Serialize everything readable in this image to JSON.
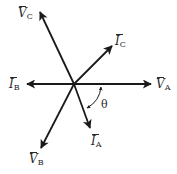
{
  "diagram": {
    "type": "phasor-diagram",
    "origin": [
      74,
      84
    ],
    "stroke_color": "#1a1a1a",
    "phasors": [
      {
        "id": "VA",
        "symbol": "V",
        "subscript": "A",
        "tip": [
          151,
          84
        ],
        "label_pos": [
          156,
          78
        ]
      },
      {
        "id": "VB",
        "symbol": "V",
        "subscript": "B",
        "tip": [
          41,
          148
        ],
        "label_pos": [
          29,
          153
        ]
      },
      {
        "id": "VC",
        "symbol": "V",
        "subscript": "C",
        "tip": [
          40,
          12
        ],
        "label_pos": [
          18,
          7
        ]
      },
      {
        "id": "IA",
        "symbol": "I",
        "subscript": "A",
        "tip": [
          90,
          128
        ],
        "label_pos": [
          91,
          135
        ]
      },
      {
        "id": "IB",
        "symbol": "I",
        "subscript": "B",
        "tip": [
          27,
          84
        ],
        "label_pos": [
          9,
          78
        ]
      },
      {
        "id": "IC",
        "symbol": "I",
        "subscript": "C",
        "tip": [
          112,
          46
        ],
        "label_pos": [
          115,
          35
        ]
      }
    ],
    "angle": {
      "label": "θ",
      "between": [
        "VA",
        "IA"
      ],
      "label_pos": [
        101,
        98
      ]
    }
  }
}
